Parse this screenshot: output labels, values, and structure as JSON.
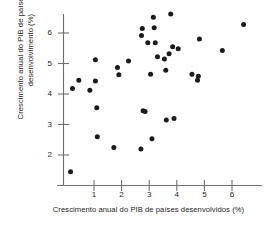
{
  "chart_data": {
    "type": "scatter",
    "title": "",
    "xlabel": "Crescimento anual do PIB de países desenvolvidos (%)",
    "ylabel": "Crescimento anual do PIB de países em desenvolvimento (%)",
    "xlabel_line1": "Crescimento anual do PIB de países",
    "xlabel_line2": "desenvolvidos (%)",
    "ylabel_line1": "Crescimento anual do PIB de países",
    "ylabel_line2": "em desenvolvimento (%)",
    "xlim": [
      -0.2,
      6.9
    ],
    "ylim": [
      1.1,
      6.9
    ],
    "xticks": [
      1,
      2,
      3,
      4,
      5,
      6
    ],
    "yticks": [
      2,
      3,
      4,
      5,
      6
    ],
    "xtick_labels": [
      "1",
      "2",
      "3",
      "4",
      "5",
      "6"
    ],
    "ytick_labels": [
      "2",
      "3",
      "4",
      "5",
      "6"
    ],
    "grid": false,
    "legend": false,
    "marker_color": "#1b1b1b",
    "axis_color": "#6f6f6f",
    "points": [
      {
        "x": 0.15,
        "y": 1.45
      },
      {
        "x": 0.22,
        "y": 4.18
      },
      {
        "x": 0.45,
        "y": 4.45
      },
      {
        "x": 0.85,
        "y": 4.12
      },
      {
        "x": 1.05,
        "y": 5.12
      },
      {
        "x": 1.05,
        "y": 4.43
      },
      {
        "x": 1.1,
        "y": 3.55
      },
      {
        "x": 1.12,
        "y": 2.6
      },
      {
        "x": 1.72,
        "y": 2.25
      },
      {
        "x": 1.85,
        "y": 4.87
      },
      {
        "x": 1.9,
        "y": 4.63
      },
      {
        "x": 2.25,
        "y": 5.08
      },
      {
        "x": 2.7,
        "y": 2.2
      },
      {
        "x": 2.72,
        "y": 5.92
      },
      {
        "x": 2.75,
        "y": 6.15
      },
      {
        "x": 2.78,
        "y": 3.45
      },
      {
        "x": 2.85,
        "y": 3.43
      },
      {
        "x": 2.95,
        "y": 5.68
      },
      {
        "x": 3.05,
        "y": 4.65
      },
      {
        "x": 3.1,
        "y": 2.53
      },
      {
        "x": 3.15,
        "y": 6.52
      },
      {
        "x": 3.18,
        "y": 6.17
      },
      {
        "x": 3.22,
        "y": 5.68
      },
      {
        "x": 3.3,
        "y": 5.22
      },
      {
        "x": 3.55,
        "y": 5.15
      },
      {
        "x": 3.6,
        "y": 4.78
      },
      {
        "x": 3.62,
        "y": 3.15
      },
      {
        "x": 3.72,
        "y": 5.32
      },
      {
        "x": 3.78,
        "y": 6.62
      },
      {
        "x": 3.85,
        "y": 5.55
      },
      {
        "x": 3.9,
        "y": 3.2
      },
      {
        "x": 4.05,
        "y": 5.48
      },
      {
        "x": 4.55,
        "y": 4.65
      },
      {
        "x": 4.75,
        "y": 4.45
      },
      {
        "x": 4.78,
        "y": 4.58
      },
      {
        "x": 4.82,
        "y": 5.8
      },
      {
        "x": 5.65,
        "y": 5.43
      },
      {
        "x": 6.42,
        "y": 6.28
      }
    ]
  }
}
